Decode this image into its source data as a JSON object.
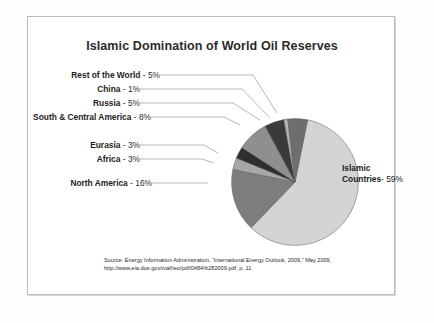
{
  "chart_data": {
    "type": "pie",
    "title": "Islamic Domination of World Oil Reserves",
    "categories": [
      "Islamic Countries",
      "North America",
      "Africa",
      "Eurasia",
      "South & Central America",
      "Russia",
      "China",
      "Rest of the World"
    ],
    "values": [
      59,
      16,
      3,
      3,
      8,
      5,
      1,
      5
    ],
    "unit": "%",
    "labels": [
      "Islamic Countries - 59%",
      "North America - 16%",
      "Africa - 3%",
      "Eurasia - 3%",
      "South & Central America - 8%",
      "Russia - 5%",
      "China - 1%",
      "Rest of the World - 5%"
    ],
    "colors": [
      "#d4d4d4",
      "#7d7d7d",
      "#a8a8a8",
      "#2f2f2f",
      "#8f8f8f",
      "#3a3a3a",
      "#b5b5b5",
      "#6e6e6e"
    ],
    "legend": "none",
    "xlabel": "",
    "ylabel": ""
  },
  "title": "Islamic Domination of World Oil Reserves",
  "slice_labels": {
    "rest_of_world": {
      "name": "Rest of the World",
      "value": "- 5%"
    },
    "china": {
      "name": "China",
      "value": "- 1%"
    },
    "russia": {
      "name": "Russia",
      "value": "- 5%"
    },
    "south_central_america": {
      "name": "South & Central America",
      "value": "- 8%"
    },
    "eurasia": {
      "name": "Eurasia",
      "value": "- 3%"
    },
    "africa": {
      "name": "Africa",
      "value": "- 3%"
    },
    "north_america": {
      "name": "North America",
      "value": "- 16%"
    },
    "islamic_countries": {
      "name_line1": "Islamic",
      "name_line2": "Countries",
      "value": "- 59%"
    }
  },
  "source": {
    "line1": "Source: Energy Information Administration, “International Energy Outlook, 2009,” May 2009,",
    "line2": "http://www.eia.doe.gov/oiaf/ieo/pdf/0484%282009.pdf, p. 11"
  }
}
